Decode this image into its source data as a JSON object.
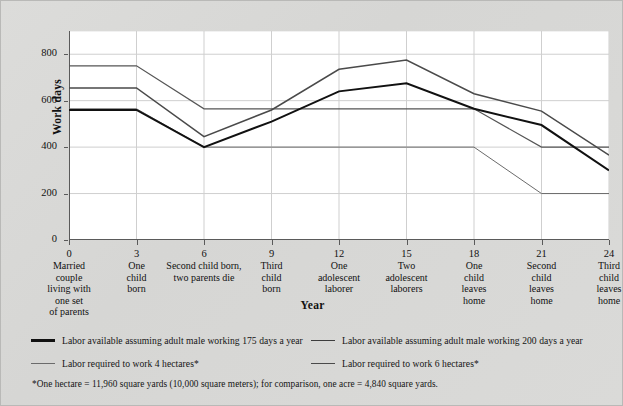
{
  "chart_data": {
    "type": "line",
    "title": "",
    "xlabel": "Year",
    "ylabel": "Work days",
    "xlim": [
      0,
      24
    ],
    "ylim": [
      0,
      900
    ],
    "grid": true,
    "legend_position": "below",
    "x_ticks": [
      0,
      3,
      6,
      9,
      12,
      15,
      18,
      21,
      24
    ],
    "y_ticks": [
      0,
      200,
      400,
      600,
      800
    ],
    "x_tick_descriptions": [
      [
        "Married",
        "couple",
        "living with",
        "one set",
        "of parents"
      ],
      [
        "One",
        "child",
        "born"
      ],
      [
        "Second child born,",
        "two parents die"
      ],
      [
        "Third",
        "child",
        "born"
      ],
      [
        "One",
        "adolescent",
        "laborer"
      ],
      [
        "Two",
        "adolescent",
        "laborers"
      ],
      [
        "One",
        "child",
        "leaves",
        "home"
      ],
      [
        "Second",
        "child",
        "leaves",
        "home"
      ],
      [
        "Third",
        "child",
        "leaves",
        "home"
      ]
    ],
    "x": [
      0,
      3,
      6,
      9,
      12,
      15,
      18,
      21,
      24
    ],
    "series": [
      {
        "name": "Labor available assuming adult male working 175 days a year",
        "style": "thick-black",
        "color": "#111111",
        "values": [
          560,
          560,
          400,
          510,
          640,
          675,
          565,
          495,
          300
        ]
      },
      {
        "name": "Labor available assuming adult male working 200 days a year",
        "style": "medium-gray",
        "color": "#4a4a4a",
        "values": [
          655,
          655,
          445,
          560,
          735,
          775,
          630,
          555,
          365
        ]
      },
      {
        "name": "Labor required to work 4 hectares*",
        "style": "thin-gray",
        "color": "#6b6b6b",
        "values": [
          565,
          565,
          400,
          400,
          400,
          400,
          400,
          200,
          200
        ]
      },
      {
        "name": "Labor required to work 6 hectares*",
        "style": "thin-dark",
        "color": "#555555",
        "values": [
          750,
          750,
          565,
          565,
          565,
          565,
          565,
          400,
          400
        ]
      }
    ],
    "footnote": "*One hectare = 11,960 square yards (10,000 square meters); for comparison, one acre = 4,840 square yards."
  },
  "legend": {
    "items": [
      {
        "label": "Labor available assuming adult male working 175 days a year",
        "swatch": "sw-thick"
      },
      {
        "label": "Labor available assuming adult male working 200 days a year",
        "swatch": "sw-mid"
      },
      {
        "label": "Labor required to work 4 hectares*",
        "swatch": "sw-thin"
      },
      {
        "label": "Labor required to work 6 hectares*",
        "swatch": "sw-thin2"
      }
    ]
  },
  "axes": {
    "y_title": "Work days",
    "x_title": "Year"
  },
  "colors": {
    "plot_background": "#ffffff",
    "figure_background": "#d9d9d7",
    "gridline": "#cfcfcf",
    "axis": "#5a5a5a",
    "text": "#111111"
  }
}
